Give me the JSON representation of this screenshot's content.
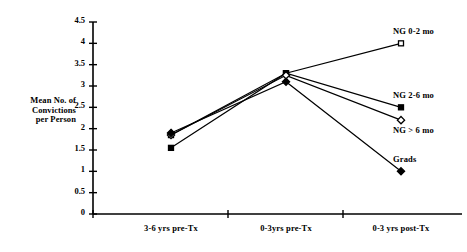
{
  "chart_data": {
    "type": "line",
    "title": "",
    "xlabel": "",
    "ylabel": "Mean No. of Convictions per Person",
    "categories": [
      "3-6 yrs pre-Tx",
      "0-3yrs pre-Tx",
      "0-3 yrs post-Tx"
    ],
    "ylim": [
      0,
      4.5
    ],
    "yticks": [
      "0",
      "0.5",
      "1",
      "1.5",
      "2",
      "2.5",
      "3",
      "3.5",
      "4",
      "4.5"
    ],
    "ytick_values": [
      0,
      0.5,
      1,
      1.5,
      2,
      2.5,
      3,
      3.5,
      4,
      4.5
    ],
    "grid": false,
    "legend_position": "at-line-ends-right",
    "series": [
      {
        "name": "NG 0-2 mo",
        "marker": "open-square",
        "values": [
          1.85,
          3.3,
          4.0
        ]
      },
      {
        "name": "NG 2-6 mo",
        "marker": "filled-square",
        "values": [
          1.55,
          3.3,
          2.5
        ]
      },
      {
        "name": "NG > 6 mo",
        "marker": "open-diamond",
        "values": [
          1.85,
          3.25,
          2.2
        ]
      },
      {
        "name": "Grads",
        "marker": "filled-diamond",
        "values": [
          1.9,
          3.1,
          1.0
        ]
      }
    ]
  },
  "axis": {
    "y_title_line1": "Mean No. of",
    "y_title_line2": "Convictions",
    "y_title_line3": "per Person"
  },
  "colors": {
    "axis": "#000000",
    "line": "#000000",
    "marker_fill": "#000000",
    "marker_open": "#ffffff",
    "background": "#ffffff"
  }
}
